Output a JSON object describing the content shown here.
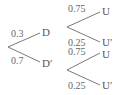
{
  "tree": {
    "level1": [
      {
        "node": "D",
        "prob": "0.3"
      },
      {
        "node": "D′",
        "prob": "0.7"
      }
    ],
    "level2": {
      "from_D": [
        {
          "node": "U",
          "prob": "0.75"
        },
        {
          "node": "U′",
          "prob": "0.25"
        }
      ],
      "from_D_prime": [
        {
          "node": "U",
          "prob": "0.75"
        },
        {
          "node": "U′",
          "prob": "0.25"
        }
      ]
    }
  },
  "colors": {
    "line": "#777777",
    "text": "#555555",
    "background": "#ffffff"
  }
}
